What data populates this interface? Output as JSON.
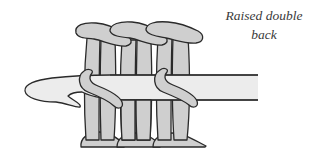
{
  "figure": {
    "caption_line1": "Raised double",
    "caption_line2": "back",
    "elements": {
      "hook": "crochet-hook",
      "stitch_columns": 3,
      "wraps_around_hook": 2
    },
    "colors": {
      "yarn": "#cfcfcf",
      "hook": "#ececec",
      "outline": "#2a2a2a",
      "background": "#ffffff",
      "caption_text": "#3a3a3a"
    }
  }
}
